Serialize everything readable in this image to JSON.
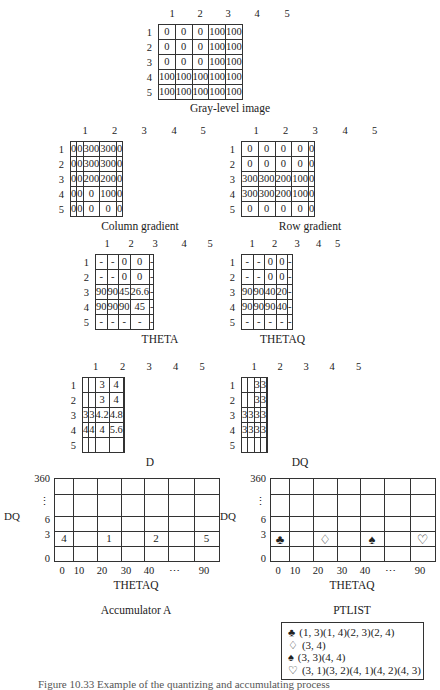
{
  "gray_level": {
    "title": "Gray-level image",
    "col_headers": [
      "1",
      "2",
      "3",
      "4",
      "5"
    ],
    "row_headers": [
      "1",
      "2",
      "3",
      "4",
      "5"
    ],
    "rows": [
      [
        "0",
        "0",
        "0",
        "100",
        "100"
      ],
      [
        "0",
        "0",
        "0",
        "100",
        "100"
      ],
      [
        "0",
        "0",
        "0",
        "100",
        "100"
      ],
      [
        "100",
        "100",
        "100",
        "100",
        "100"
      ],
      [
        "100",
        "100",
        "100",
        "100",
        "100"
      ]
    ]
  },
  "column_gradient": {
    "title": "Column gradient",
    "col_headers": [
      "1",
      "2",
      "3",
      "4",
      "5"
    ],
    "row_headers": [
      "1",
      "2",
      "3",
      "4",
      "5"
    ],
    "rows": [
      [
        "0",
        "0",
        "300",
        "300",
        "0"
      ],
      [
        "0",
        "0",
        "300",
        "300",
        "0"
      ],
      [
        "0",
        "0",
        "200",
        "200",
        "0"
      ],
      [
        "0",
        "0",
        "0",
        "100",
        "0"
      ],
      [
        "0",
        "0",
        "0",
        "0",
        "0"
      ]
    ]
  },
  "row_gradient": {
    "title": "Row gradient",
    "col_headers": [
      "1",
      "2",
      "3",
      "4",
      "5"
    ],
    "row_headers": [
      "1",
      "2",
      "3",
      "4",
      "5"
    ],
    "rows": [
      [
        "0",
        "0",
        "0",
        "0",
        "0"
      ],
      [
        "0",
        "0",
        "0",
        "0",
        "0"
      ],
      [
        "300",
        "300",
        "200",
        "100",
        "0"
      ],
      [
        "300",
        "300",
        "200",
        "100",
        "0"
      ],
      [
        "0",
        "0",
        "0",
        "0",
        "0"
      ]
    ]
  },
  "theta": {
    "title": "THETA",
    "col_headers": [
      "1",
      "2",
      "3",
      "4",
      "5"
    ],
    "row_headers": [
      "1",
      "2",
      "3",
      "4",
      "5"
    ],
    "rows": [
      [
        "-",
        "-",
        "0",
        "0",
        "-"
      ],
      [
        "-",
        "-",
        "0",
        "0",
        "-"
      ],
      [
        "90",
        "90",
        "45",
        "26.6",
        "-"
      ],
      [
        "90",
        "90",
        "90",
        "45",
        "-"
      ],
      [
        "-",
        "-",
        "-",
        "-",
        "-"
      ]
    ]
  },
  "thetaq": {
    "title": "THETAQ",
    "col_headers": [
      "1",
      "2",
      "3",
      "4",
      "5"
    ],
    "row_headers": [
      "1",
      "2",
      "3",
      "4",
      "5"
    ],
    "rows": [
      [
        "-",
        "-",
        "0",
        "0",
        "-"
      ],
      [
        "-",
        "-",
        "0",
        "0",
        "-"
      ],
      [
        "90",
        "90",
        "40",
        "20",
        "-"
      ],
      [
        "90",
        "90",
        "90",
        "40",
        "-"
      ],
      [
        "-",
        "-",
        "-",
        "-",
        "-"
      ]
    ]
  },
  "d": {
    "title": "D",
    "col_headers": [
      "1",
      "2",
      "3",
      "4",
      "5"
    ],
    "row_headers": [
      "1",
      "2",
      "3",
      "4",
      "5"
    ],
    "rows": [
      [
        "",
        "",
        "3",
        "4",
        ""
      ],
      [
        "",
        "",
        "3",
        "4",
        ""
      ],
      [
        "3",
        "3",
        "4.2",
        "4.8",
        ""
      ],
      [
        "4",
        "4",
        "4",
        "5.6",
        ""
      ],
      [
        "",
        "",
        "",
        "",
        ""
      ]
    ]
  },
  "dq": {
    "title": "DQ",
    "col_headers": [
      "1",
      "2",
      "3",
      "4",
      "5"
    ],
    "row_headers": [
      "1",
      "2",
      "3",
      "4",
      "5"
    ],
    "rows": [
      [
        "",
        "",
        "3",
        "3",
        ""
      ],
      [
        "",
        "",
        "3",
        "3",
        ""
      ],
      [
        "3",
        "3",
        "3",
        "3",
        ""
      ],
      [
        "3",
        "3",
        "3",
        "3",
        ""
      ],
      [
        "",
        "",
        "",
        "",
        ""
      ]
    ]
  },
  "accumulator": {
    "title": "Accumulator A",
    "ylabel": "DQ",
    "xlabel": "THETAQ",
    "y_ticks": [
      "360",
      "⋮",
      "6",
      "3",
      "0"
    ],
    "x_ticks": [
      "0",
      "10",
      "20",
      "30",
      "40",
      "⋯",
      "90"
    ],
    "row3_values": [
      "4",
      "",
      "1",
      "",
      "2",
      "",
      "5"
    ]
  },
  "ptlist_plot": {
    "title": "PTLIST",
    "ylabel": "DQ",
    "xlabel": "THETAQ",
    "y_ticks": [
      "360",
      "⋮",
      "6",
      "3",
      "0"
    ],
    "x_ticks": [
      "0",
      "10",
      "20",
      "30",
      "40",
      "⋯",
      "90"
    ],
    "row3_symbols": [
      "♣",
      "",
      "♢",
      "",
      "♠",
      "",
      "♡"
    ]
  },
  "ptlist": {
    "entries": [
      {
        "symbol": "♣",
        "points": "(1, 3)(1, 4)(2, 3)(2, 4)"
      },
      {
        "symbol": "♢",
        "points": "(3, 4)"
      },
      {
        "symbol": "♠",
        "points": "(3, 3)(4, 4)"
      },
      {
        "symbol": "♡",
        "points": "(3, 1)(3, 2)(4, 1)(4, 2)(4, 3)"
      }
    ]
  },
  "figure_caption": "Figure 10.33  Example of the quantizing and accumulating process"
}
